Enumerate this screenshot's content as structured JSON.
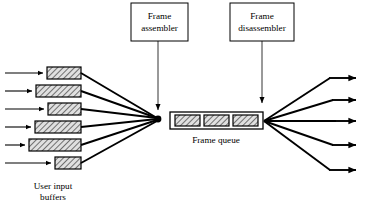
{
  "diagram": {
    "background_color": "#ffffff",
    "line_color": "#000000",
    "hatch_fill_color": "#d8d8d8",
    "boxes": [
      {
        "id": "frame-assembler",
        "line1": "Frame",
        "line2": "assembler",
        "x": 131,
        "y": 3,
        "w": 57,
        "h": 38,
        "pointer_to_x": 158,
        "pointer_to_y": 112
      },
      {
        "id": "frame-disassembler",
        "line1": "Frame",
        "line2": "disassembler",
        "x": 230,
        "y": 3,
        "w": 64,
        "h": 38,
        "pointer_to_x": 262,
        "pointer_to_y": 104
      }
    ],
    "labels": [
      {
        "id": "user-input-buffers",
        "line1": "User input",
        "line2": "buffers",
        "x": 53,
        "y": 189
      },
      {
        "id": "frame-queue",
        "line1": "Frame queue",
        "line2": "",
        "x": 216,
        "y": 143
      }
    ],
    "buffers": [
      {
        "index": 0,
        "x": 47,
        "y": 67,
        "w": 34,
        "h": 12
      },
      {
        "index": 1,
        "x": 36,
        "y": 85,
        "w": 45,
        "h": 12
      },
      {
        "index": 2,
        "x": 48,
        "y": 103,
        "w": 33,
        "h": 12
      },
      {
        "index": 3,
        "x": 35,
        "y": 121,
        "w": 46,
        "h": 12
      },
      {
        "index": 4,
        "x": 29,
        "y": 139,
        "w": 52,
        "h": 12
      },
      {
        "index": 5,
        "x": 55,
        "y": 157,
        "w": 26,
        "h": 12
      }
    ],
    "input_arrows": [
      {
        "index": 0,
        "x1": 5,
        "y1": 73,
        "x2": 46,
        "y2": 73
      },
      {
        "index": 1,
        "x1": 5,
        "y1": 91,
        "x2": 35,
        "y2": 91
      },
      {
        "index": 2,
        "x1": 5,
        "y1": 109,
        "x2": 47,
        "y2": 109
      },
      {
        "index": 3,
        "x1": 5,
        "y1": 127,
        "x2": 34,
        "y2": 127
      },
      {
        "index": 4,
        "x1": 5,
        "y1": 145,
        "x2": 28,
        "y2": 145
      },
      {
        "index": 5,
        "x1": 5,
        "y1": 163,
        "x2": 54,
        "y2": 163
      }
    ],
    "converge_point": {
      "x": 158,
      "y": 119,
      "radius": 3.2
    },
    "fan_in_lines": [
      {
        "from_x": 81,
        "from_y": 73
      },
      {
        "from_x": 81,
        "from_y": 91
      },
      {
        "from_x": 81,
        "from_y": 109
      },
      {
        "from_x": 81,
        "from_y": 127
      },
      {
        "from_x": 81,
        "from_y": 145
      },
      {
        "from_x": 81,
        "from_y": 163
      }
    ],
    "queue": {
      "x": 170,
      "y": 112,
      "w": 93,
      "h": 17,
      "cells": [
        {
          "index": 0,
          "x": 174,
          "y": 115,
          "w": 25,
          "h": 11
        },
        {
          "index": 1,
          "x": 204,
          "y": 115,
          "w": 25,
          "h": 11
        },
        {
          "index": 2,
          "x": 233,
          "y": 115,
          "w": 25,
          "h": 11
        }
      ]
    },
    "fan_out_point": {
      "x": 264,
      "y": 121
    },
    "output_arrows": [
      {
        "index": 0,
        "mid_x": 330,
        "mid_y": 78,
        "end_x": 362,
        "end_y": 78
      },
      {
        "index": 1,
        "mid_x": 333,
        "mid_y": 100,
        "end_x": 362,
        "end_y": 100
      },
      {
        "index": 2,
        "mid_x": 336,
        "mid_y": 121,
        "end_x": 362,
        "end_y": 121
      },
      {
        "index": 3,
        "mid_x": 333,
        "mid_y": 145,
        "end_x": 362,
        "end_y": 145
      },
      {
        "index": 4,
        "mid_x": 330,
        "mid_y": 170,
        "end_x": 362,
        "end_y": 170
      }
    ]
  }
}
